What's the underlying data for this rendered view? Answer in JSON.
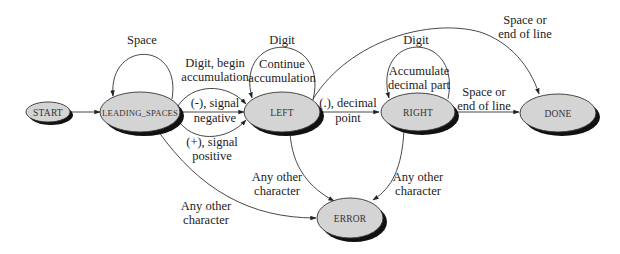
{
  "diagram": {
    "type": "state-machine",
    "title": "",
    "nodes": [
      {
        "id": "start",
        "label": "START"
      },
      {
        "id": "leading_spaces",
        "label": "LEADING_SPACES"
      },
      {
        "id": "left",
        "label": "LEFT"
      },
      {
        "id": "right",
        "label": "RIGHT"
      },
      {
        "id": "done",
        "label": "DONE"
      },
      {
        "id": "error",
        "label": "ERROR"
      }
    ],
    "edges": [
      {
        "from": "start",
        "to": "leading_spaces",
        "label": ""
      },
      {
        "from": "leading_spaces",
        "to": "leading_spaces",
        "label_lines": [
          "Space"
        ]
      },
      {
        "from": "leading_spaces",
        "to": "left",
        "label_lines": [
          "Digit, begin",
          "accumulation"
        ]
      },
      {
        "from": "leading_spaces",
        "to": "left",
        "label_lines": [
          "(-), signal",
          "negative"
        ]
      },
      {
        "from": "leading_spaces",
        "to": "left",
        "label_lines": [
          "(+), signal",
          "positive"
        ]
      },
      {
        "from": "leading_spaces",
        "to": "error",
        "label_lines": [
          "Any other",
          "character"
        ]
      },
      {
        "from": "left",
        "to": "left",
        "label_lines": [
          "Digit"
        ],
        "inner_lines": [
          "Continue",
          "accumulation"
        ]
      },
      {
        "from": "left",
        "to": "right",
        "label_lines": [
          "(.), decimal",
          "point"
        ]
      },
      {
        "from": "left",
        "to": "done",
        "label_lines": [
          "Space or",
          "end of line"
        ]
      },
      {
        "from": "left",
        "to": "error",
        "label_lines": [
          "Any other",
          "character"
        ]
      },
      {
        "from": "right",
        "to": "right",
        "label_lines": [
          "Digit"
        ],
        "inner_lines": [
          "Accumulate",
          "decimal part"
        ]
      },
      {
        "from": "right",
        "to": "done",
        "label_lines": [
          "Space or",
          "end of line"
        ]
      },
      {
        "from": "right",
        "to": "error",
        "label_lines": [
          "Any other",
          "character"
        ]
      }
    ]
  }
}
